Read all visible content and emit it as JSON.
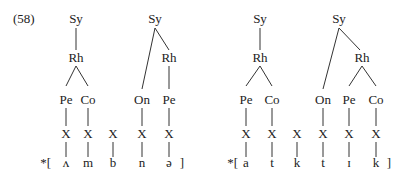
{
  "example_number": "(58)",
  "diagrams": [
    {
      "id": "left",
      "prefix": "*[",
      "suffix": "]",
      "timing_slot_label": "X",
      "segments": [
        "ʌ",
        "m",
        "b",
        "n",
        "ə"
      ],
      "syllables": [
        {
          "root": "Sy",
          "rhyme": "Rh",
          "onset": null,
          "peak": "Pe",
          "coda": "Co"
        },
        {
          "root": "Sy",
          "rhyme": "Rh",
          "onset": "On",
          "peak": "Pe",
          "coda": null
        }
      ]
    },
    {
      "id": "right",
      "prefix": "*[",
      "suffix": "]",
      "timing_slot_label": "X",
      "segments": [
        "a",
        "t",
        "k",
        "t",
        "ɪ",
        "k"
      ],
      "syllables": [
        {
          "root": "Sy",
          "rhyme": "Rh",
          "onset": null,
          "peak": "Pe",
          "coda": "Co"
        },
        {
          "root": "Sy",
          "rhyme": "Rh",
          "onset": "On",
          "peak": "Pe",
          "coda": "Co"
        }
      ]
    }
  ]
}
